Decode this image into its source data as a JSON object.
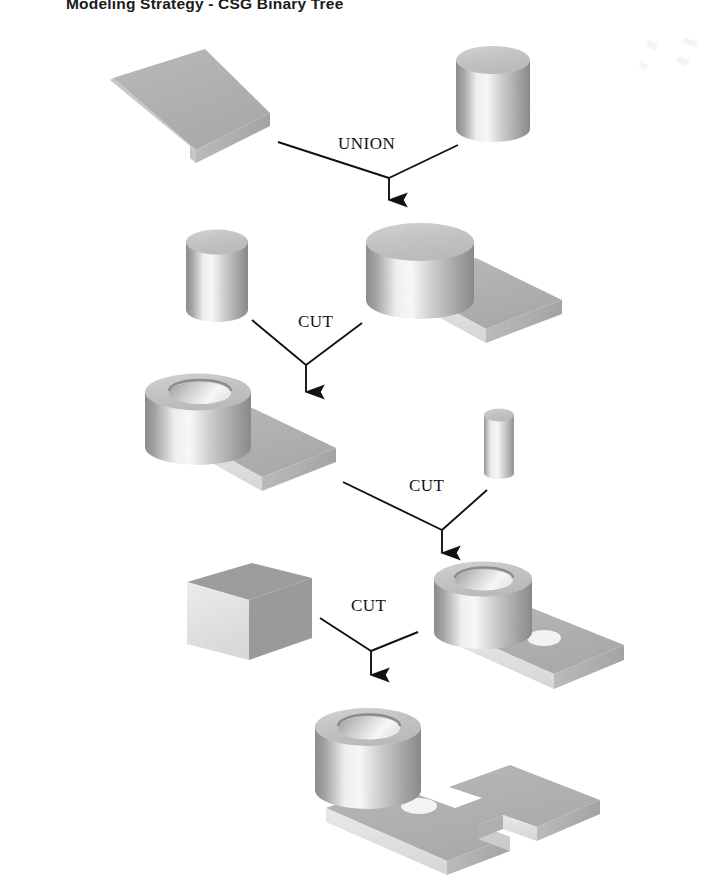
{
  "document": {
    "title": "Modeling Strategy - CSG Binary Tree",
    "background_color": "#ffffff",
    "width": 714,
    "height": 884
  },
  "palette": {
    "ink": "#111111",
    "face_top": "#b5b5b5",
    "face_front": "#e8e8e8",
    "face_side": "#9a9a9a",
    "face_dark": "#8a8a8a",
    "highlight": "#f6f6f6",
    "hole_shadow": "#8f8f8f"
  },
  "operations": [
    {
      "id": "op-union",
      "label": "UNION",
      "label_x": 338,
      "label_y": 143
    },
    {
      "id": "op-cut-1",
      "label": "CUT",
      "label_x": 298,
      "label_y": 321
    },
    {
      "id": "op-cut-2",
      "label": "CUT",
      "label_x": 409,
      "label_y": 484
    },
    {
      "id": "op-cut-3",
      "label": "CUT",
      "label_x": 351,
      "label_y": 604
    }
  ],
  "nodes": [
    {
      "id": "leaf-base-slab",
      "name": "base-slab-block",
      "row": 1,
      "role": "leaf"
    },
    {
      "id": "leaf-big-cyl",
      "name": "large-cylinder",
      "row": 1,
      "role": "leaf"
    },
    {
      "id": "leaf-bore-cyl",
      "name": "bore-cylinder",
      "row": 2,
      "role": "leaf"
    },
    {
      "id": "node-union",
      "name": "union-result-cylinder-on-slab",
      "row": 2,
      "role": "intermediate"
    },
    {
      "id": "node-cut1",
      "name": "cut1-result-hollow-boss",
      "row": 3,
      "role": "intermediate"
    },
    {
      "id": "leaf-small-cyl",
      "name": "small-hole-cylinder",
      "row": 3,
      "role": "leaf"
    },
    {
      "id": "leaf-wall-block",
      "name": "notch-wall-block",
      "row": 4,
      "role": "leaf"
    },
    {
      "id": "node-cut2",
      "name": "cut2-result-two-holes",
      "row": 4,
      "role": "intermediate"
    },
    {
      "id": "node-final",
      "name": "final-part",
      "row": 5,
      "role": "result"
    }
  ],
  "connectors": [
    {
      "id": "conn-union",
      "from": [
        "leaf-base-slab",
        "leaf-big-cyl"
      ],
      "to": "node-union"
    },
    {
      "id": "conn-cut-1",
      "from": [
        "leaf-bore-cyl",
        "node-union"
      ],
      "to": "node-cut1"
    },
    {
      "id": "conn-cut-2",
      "from": [
        "node-cut1",
        "leaf-small-cyl"
      ],
      "to": "node-cut2"
    },
    {
      "id": "conn-cut-3",
      "from": [
        "leaf-wall-block",
        "node-cut2"
      ],
      "to": "node-final"
    }
  ]
}
